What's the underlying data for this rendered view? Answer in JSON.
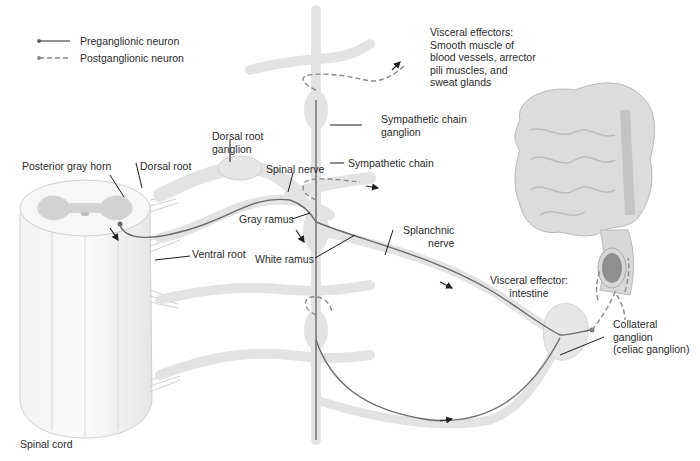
{
  "legend": {
    "items": [
      {
        "label": "Preganglionic neuron",
        "style": "solid"
      },
      {
        "label": "Postganglionic neuron",
        "style": "dashed"
      }
    ]
  },
  "labels": {
    "visceral_effectors_top": "Visceral effectors:\nSmooth muscle of\nblood vessels, arrector\npili muscles, and\nsweat glands",
    "sympathetic_chain_ganglion": "Sympathetic chain\nganglion",
    "sympathetic_chain": "Sympathetic chain",
    "dorsal_root_ganglion": "Dorsal root\nganglion",
    "posterior_gray_horn": "Posterior gray horn",
    "dorsal_root": "Dorsal root",
    "spinal_nerve": "Spinal nerve",
    "gray_ramus": "Gray ramus",
    "white_ramus": "White ramus",
    "ventral_root": "Ventral root",
    "splanchnic_nerve": "Splanchnic\nnerve",
    "visceral_effector_intestine": "Visceral effector:\nintestine",
    "collateral_ganglion": "Collateral\nganglion\n(celiac ganglion)",
    "spinal_cord": "Spinal cord"
  },
  "colors": {
    "tissue_fill": "#ececec",
    "tissue_stroke": "#c8c8c8",
    "gray_matter": "#cfcfcf",
    "neuron_line": "#6a6a6a",
    "leader_line": "#1a1a1a",
    "dashed_neuron": "#8a8a8a"
  }
}
